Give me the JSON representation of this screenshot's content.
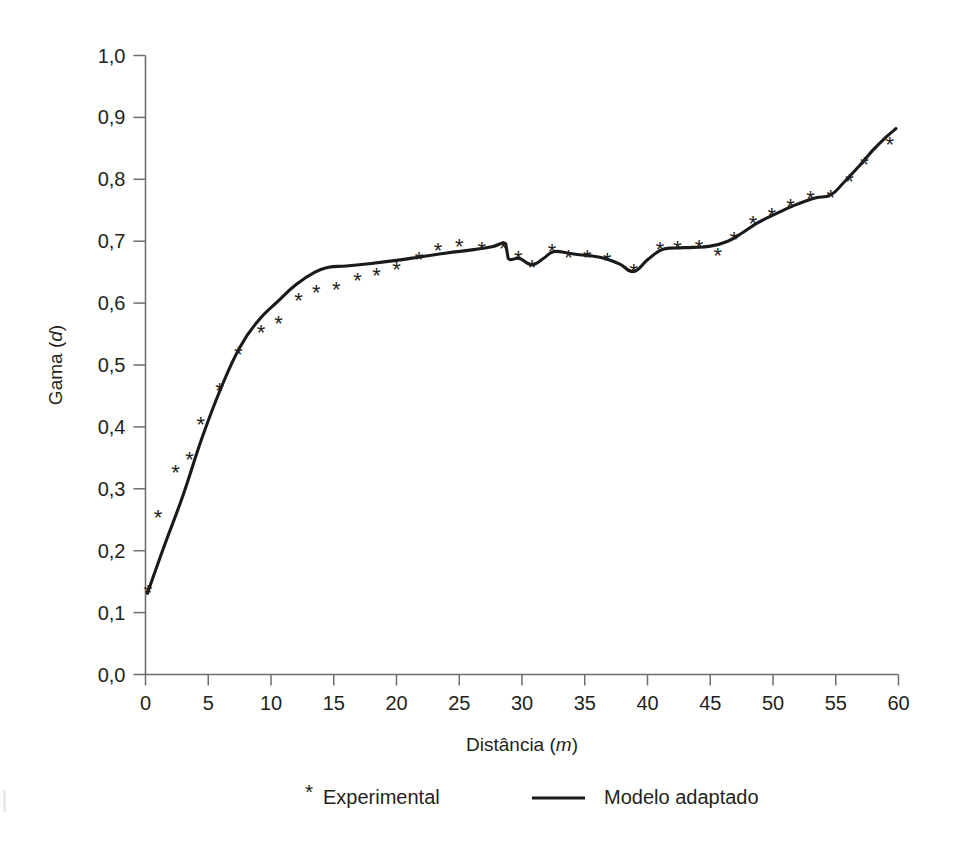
{
  "chart_data": {
    "type": "line",
    "title": "",
    "xlabel": "Distância (m)",
    "xlabel_text": "Distância",
    "xlabel_unit": "m",
    "ylabel": "Gama (d)",
    "ylabel_text": "Gama",
    "ylabel_unit": "d",
    "xlim": [
      0,
      60
    ],
    "ylim": [
      0.0,
      1.0
    ],
    "xticks": [
      0,
      5,
      10,
      15,
      20,
      25,
      30,
      35,
      40,
      45,
      50,
      55,
      60
    ],
    "xtick_labels": [
      "0",
      "5",
      "10",
      "15",
      "20",
      "25",
      "30",
      "35",
      "40",
      "45",
      "50",
      "55",
      "60"
    ],
    "yticks": [
      0.0,
      0.1,
      0.2,
      0.3,
      0.4,
      0.5,
      0.6,
      0.7,
      0.8,
      0.9,
      1.0
    ],
    "ytick_labels": [
      "0,0",
      "0,1",
      "0,2",
      "0,3",
      "0,4",
      "0,5",
      "0,6",
      "0,7",
      "0,8",
      "0,9",
      "1,0"
    ],
    "grid": false,
    "legend_position": "below",
    "line_color": "#1a1a1a",
    "axis_color": "#6d6e71",
    "text_color": "#231f20",
    "series": [
      {
        "name": "Experimental",
        "marker": "*",
        "type": "scatter",
        "points": [
          [
            0.2,
            0.133
          ],
          [
            1.0,
            0.255
          ],
          [
            2.4,
            0.327
          ],
          [
            3.5,
            0.348
          ],
          [
            4.4,
            0.405
          ],
          [
            5.9,
            0.46
          ],
          [
            7.4,
            0.518
          ],
          [
            9.2,
            0.554
          ],
          [
            10.6,
            0.568
          ],
          [
            12.2,
            0.605
          ],
          [
            13.6,
            0.618
          ],
          [
            15.2,
            0.623
          ],
          [
            16.9,
            0.637
          ],
          [
            18.4,
            0.645
          ],
          [
            20.0,
            0.655
          ],
          [
            21.8,
            0.672
          ],
          [
            23.3,
            0.686
          ],
          [
            25.0,
            0.693
          ],
          [
            26.8,
            0.688
          ],
          [
            28.5,
            0.689
          ],
          [
            29.7,
            0.673
          ],
          [
            30.8,
            0.659
          ],
          [
            32.4,
            0.684
          ],
          [
            33.7,
            0.675
          ],
          [
            35.2,
            0.675
          ],
          [
            36.8,
            0.669
          ],
          [
            38.9,
            0.652
          ],
          [
            41.0,
            0.688
          ],
          [
            42.4,
            0.689
          ],
          [
            44.1,
            0.69
          ],
          [
            45.6,
            0.678
          ],
          [
            46.9,
            0.703
          ],
          [
            48.4,
            0.729
          ],
          [
            49.9,
            0.743
          ],
          [
            51.4,
            0.757
          ],
          [
            53.0,
            0.77
          ],
          [
            54.6,
            0.771
          ],
          [
            56.1,
            0.798
          ],
          [
            57.3,
            0.825
          ],
          [
            59.3,
            0.857
          ]
        ]
      },
      {
        "name": "Modelo adaptado",
        "type": "line",
        "points": [
          [
            0.15,
            0.131
          ],
          [
            1.5,
            0.208
          ],
          [
            3.0,
            0.29
          ],
          [
            4.5,
            0.382
          ],
          [
            6.0,
            0.462
          ],
          [
            7.5,
            0.528
          ],
          [
            9.0,
            0.572
          ],
          [
            10.5,
            0.602
          ],
          [
            12.0,
            0.63
          ],
          [
            13.5,
            0.65
          ],
          [
            14.6,
            0.658
          ],
          [
            16.0,
            0.66
          ],
          [
            18.0,
            0.664
          ],
          [
            20.0,
            0.669
          ],
          [
            22.0,
            0.675
          ],
          [
            24.0,
            0.681
          ],
          [
            26.0,
            0.686
          ],
          [
            27.6,
            0.691
          ],
          [
            28.7,
            0.696
          ],
          [
            28.9,
            0.672
          ],
          [
            29.8,
            0.672
          ],
          [
            30.8,
            0.662
          ],
          [
            31.7,
            0.672
          ],
          [
            32.5,
            0.683
          ],
          [
            33.6,
            0.681
          ],
          [
            34.6,
            0.678
          ],
          [
            35.6,
            0.676
          ],
          [
            36.6,
            0.672
          ],
          [
            37.8,
            0.663
          ],
          [
            38.9,
            0.651
          ],
          [
            40.0,
            0.67
          ],
          [
            41.1,
            0.686
          ],
          [
            42.2,
            0.689
          ],
          [
            43.6,
            0.69
          ],
          [
            45.0,
            0.692
          ],
          [
            46.4,
            0.7
          ],
          [
            47.6,
            0.714
          ],
          [
            48.8,
            0.73
          ],
          [
            50.2,
            0.744
          ],
          [
            51.6,
            0.757
          ],
          [
            53.2,
            0.769
          ],
          [
            54.6,
            0.775
          ],
          [
            55.6,
            0.794
          ],
          [
            56.8,
            0.82
          ],
          [
            58.0,
            0.848
          ],
          [
            59.0,
            0.868
          ],
          [
            59.8,
            0.882
          ]
        ]
      }
    ],
    "legend": [
      {
        "marker": "*",
        "label": "Experimental",
        "kind": "marker"
      },
      {
        "marker": "line",
        "label": "Modelo adaptado",
        "kind": "line"
      }
    ]
  }
}
